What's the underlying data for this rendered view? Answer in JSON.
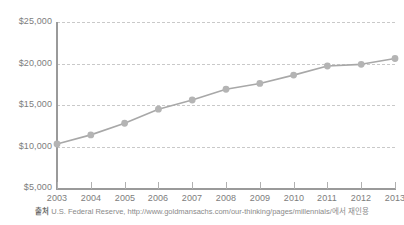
{
  "chart_data": {
    "type": "line",
    "title": "",
    "subtitle": "",
    "xlabel": "",
    "ylabel": "",
    "categories": [
      "2003",
      "2004",
      "2005",
      "2006",
      "2007",
      "2008",
      "2009",
      "2010",
      "2011",
      "2012",
      "2013"
    ],
    "values": [
      10300,
      11400,
      12800,
      14500,
      15600,
      16900,
      17600,
      18600,
      19700,
      19900,
      20600
    ],
    "series": [
      {
        "name": "",
        "values": [
          10300,
          11400,
          12800,
          14500,
          15600,
          16900,
          17600,
          18600,
          19700,
          19900,
          20600
        ]
      }
    ],
    "ylim": [
      5000,
      25000
    ],
    "ytick_values": [
      5000,
      10000,
      15000,
      20000,
      25000
    ],
    "ytick_labels": [
      "$5,000",
      "$10,000",
      "$15,000",
      "$20,000",
      "$25,000"
    ],
    "xtick_labels": [
      "2003",
      "2004",
      "2005",
      "2006",
      "2007",
      "2008",
      "2009",
      "2010",
      "2011",
      "2012",
      "2013"
    ],
    "grid": true,
    "grid_style": "dashed-horizontal",
    "legend": false,
    "legend_position": "none",
    "line_color": "#a8a8a8",
    "marker_color": "#b4b4b4",
    "marker_shape": "circle",
    "axis_color": "#9a9a9a",
    "grid_color": "#c9c9c9",
    "text_color": "#7d7d7d",
    "background_color": "#ffffff"
  },
  "source": {
    "tag": "출처",
    "text": " U.S. Federal Reserve, http://www.goldmansachs.com/our-thinking/pages/millennials/에서 재인용"
  }
}
